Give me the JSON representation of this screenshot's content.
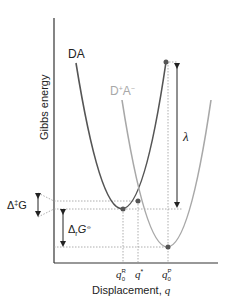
{
  "diagram": {
    "axes": {
      "y_label": "Gibbs energy",
      "x_label_prefix": "Displacement, ",
      "x_label_var": "q"
    },
    "curves": [
      {
        "name": "DA",
        "label": "DA",
        "color": "#555555"
      },
      {
        "name": "D+A-",
        "label_base": "D",
        "label_sup1": "+",
        "label_mid": "A",
        "label_sup2": "−",
        "color": "#a8a8a8"
      }
    ],
    "x_ticks": [
      {
        "var": "q",
        "sub": "0",
        "sup": "R"
      },
      {
        "var": "q",
        "sup": "*"
      },
      {
        "var": "q",
        "sub": "0",
        "sup": "P"
      }
    ],
    "annotations": {
      "reorganization": "λ",
      "activation_prefix": "Δ",
      "activation_sup": "‡",
      "activation_var": "G",
      "reaction_prefix": "Δ",
      "reaction_sub": "r",
      "reaction_var": "G",
      "reaction_sup": "⦵"
    },
    "colors": {
      "reactant_curve": "#555555",
      "product_curve": "#a8a8a8",
      "axis": "#333333",
      "guide": "#999999",
      "point": "#555555"
    }
  }
}
